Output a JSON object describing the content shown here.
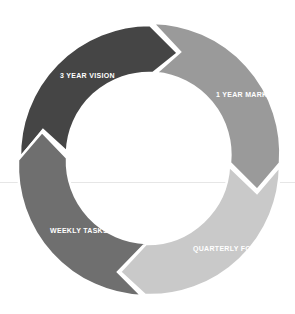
{
  "diagram": {
    "type": "cycle",
    "center": [
      148,
      155
    ],
    "outer_radius": 130,
    "inner_radius": 82,
    "segments": [
      {
        "label": "3 YEAR VISION",
        "color": "#454545",
        "order": 1
      },
      {
        "label": "1 YEAR MARKERS",
        "color": "#9a9a9a",
        "order": 2
      },
      {
        "label": "QUARTERLY FOCUS",
        "color": "#c9c9c9",
        "order": 3
      },
      {
        "label": "WEEKLY TASKS",
        "color": "#6f6f6f",
        "order": 4
      }
    ],
    "separator_color": "#ffffff",
    "background": "#ffffff"
  }
}
